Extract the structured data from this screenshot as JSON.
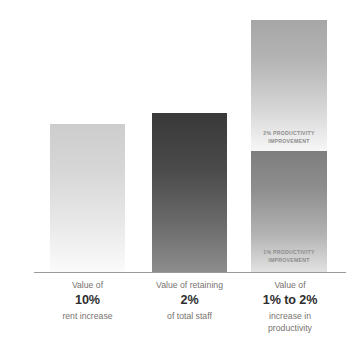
{
  "chart_data": {
    "type": "bar",
    "title": "",
    "subtitle": "",
    "xlabel": "",
    "ylabel": "DOLLARS",
    "grid": false,
    "legend": "none",
    "axis": {
      "y_tick_labels": [],
      "x_tick_labels": []
    },
    "categories": [
      "Value of 10% rent increase",
      "Value of retaining 2% of total staff",
      "Value of 1% to 2% increase in productivity"
    ],
    "values": [
      148,
      159,
      252
    ],
    "value_unit": "relative dollars (unlabeled axis)",
    "series": [
      {
        "name": "1% productivity improvement",
        "values": [
          0,
          0,
          121
        ]
      },
      {
        "name": "2% productivity improvement",
        "values": [
          0,
          0,
          131
        ]
      }
    ],
    "bars": [
      {
        "id": "rent",
        "height": 148,
        "stacked": false,
        "color_top": "#cdcdcd",
        "color_bottom": "#fbfbfb",
        "label_lines": [
          "Value of",
          "10%",
          "rent increase"
        ],
        "emphasis_line_index": 1
      },
      {
        "id": "staff",
        "height": 159,
        "stacked": false,
        "color_top": "#393939",
        "color_bottom": "#8d8d8d",
        "label_lines": [
          "Value of retaining",
          "2%",
          "of total staff"
        ],
        "emphasis_line_index": 1
      },
      {
        "id": "productivity",
        "height": 252,
        "stacked": true,
        "segments": [
          {
            "id": "two-percent",
            "height": 131,
            "label": "2% PRODUCTIVITY\nIMPROVEMENT",
            "color_top": "#a6a6a6",
            "color_bottom": "#f7f7f7"
          },
          {
            "id": "one-percent",
            "height": 121,
            "label": "1% PRODUCTIVITY\nIMPROVEMENT",
            "color_top": "#7e7e7e",
            "color_bottom": "#e2e2e2"
          }
        ],
        "label_lines": [
          "Value of",
          "1% to 2%",
          "increase in",
          "productivity"
        ],
        "emphasis_line_index": 1
      }
    ]
  },
  "axis": {
    "y_label": "DOLLARS"
  },
  "categories": [
    {
      "id": "rent",
      "line1": "Value of",
      "value": "10%",
      "line3": "rent increase",
      "line4": ""
    },
    {
      "id": "staff",
      "line1": "Value of retaining",
      "value": "2%",
      "line3": "of total staff",
      "line4": ""
    },
    {
      "id": "productivity",
      "line1": "Value of",
      "value": "1% to 2%",
      "line3": "increase in",
      "line4": "productivity"
    }
  ],
  "segments": {
    "two_percent_label": "2% PRODUCTIVITY\nIMPROVEMENT",
    "one_percent_label": "1% PRODUCTIVITY\nIMPROVEMENT"
  },
  "colors": {
    "background": "#ffffff",
    "baseline": "#9a9a9a",
    "axis_label": "#3d3d3d",
    "category_text": "#77736f",
    "category_value": "#2e2e2e",
    "segment_label": "#8d8d8d"
  }
}
